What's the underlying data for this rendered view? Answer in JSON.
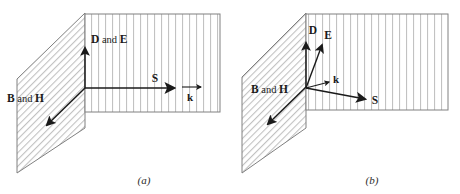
{
  "panel_a": {
    "caption": "(a)",
    "de_label": {
      "bold1": "D",
      "mid": " and ",
      "bold2": "E"
    },
    "s_label": "S",
    "k_label": "k",
    "bh_label": {
      "bold1": "B",
      "mid": " and ",
      "bold2": "H"
    }
  },
  "panel_b": {
    "caption": "(b)",
    "d_label": "D",
    "e_label": "E",
    "k_label": "k",
    "s_label": "S",
    "bh_label": {
      "bold1": "B",
      "mid": " and ",
      "bold2": "H"
    }
  },
  "colors": {
    "background": "#ffffff",
    "hatch_line": "#b3b3b3",
    "plane_outline": "#808080",
    "arrow": "#1a1a1a",
    "text": "#1a1a1a"
  }
}
